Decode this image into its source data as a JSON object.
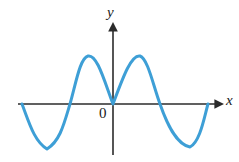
{
  "figure": {
    "title": "",
    "background_color": "#ffffff",
    "width": 239,
    "height": 162
  },
  "labels": {
    "x_axis": "x",
    "y_axis": "y",
    "origin": "0"
  },
  "colors": {
    "curve": "#3e9fd6",
    "axis": "#2b2b2b",
    "text": "#1a1a1a"
  },
  "chart_data": {
    "type": "line",
    "title": "",
    "xlabel": "x",
    "ylabel": "y",
    "grid": false,
    "legend": null,
    "annotations": [
      "0"
    ],
    "axes": {
      "x_axis_y_pixel": 104,
      "y_axis_x_pixel": 113,
      "x_axis_start_pixel": 18,
      "x_axis_arrow_tip_pixel": 222,
      "y_axis_arrow_tip_pixel": 24,
      "y_axis_bottom_pixel": 155,
      "ticks_x": [],
      "ticks_y": [],
      "xlim": [
        -3.6,
        4.1
      ],
      "ylim": [
        -1.15,
        1.6
      ]
    },
    "key_points": [
      {
        "label": "curve-start",
        "x_pixel": 22,
        "y_pixel": 104,
        "x": -3.4,
        "y": 0
      },
      {
        "label": "left-trough",
        "x_pixel": 47,
        "y_pixel": 149,
        "x": -2.5,
        "y": -1
      },
      {
        "label": "left-zero-crossing",
        "x_pixel": 70,
        "y_pixel": 104,
        "x": -1.65,
        "y": 0
      },
      {
        "label": "left-peak",
        "x_pixel": 88,
        "y_pixel": 56,
        "x": -1.0,
        "y": 1.05
      },
      {
        "label": "origin-cusp",
        "x_pixel": 113,
        "y_pixel": 104,
        "x": 0,
        "y": 0
      },
      {
        "label": "right-peak",
        "x_pixel": 140,
        "y_pixel": 56,
        "x": 1.0,
        "y": 1.05
      },
      {
        "label": "right-zero-crossing",
        "x_pixel": 160,
        "y_pixel": 104,
        "x": 1.65,
        "y": 0
      },
      {
        "label": "right-trough",
        "x_pixel": 190,
        "y_pixel": 147,
        "x": 2.5,
        "y": -0.95
      },
      {
        "label": "curve-end",
        "x_pixel": 208,
        "y_pixel": 104,
        "x": 3.2,
        "y": 0
      }
    ],
    "series": [
      {
        "name": "curve",
        "color": "#3e9fd6",
        "stroke_width": 3,
        "path": "M 22,104 C 29,122 34,141 47,149 C 60,141 64,124 70,104 C 76,83 80,58 88,56 C 97,54 104,80 113,104 C 122,80 131,54 140,56 C 148,59 153,85 160,104 C 167,124 176,144 190,147 C 200,142 204,118 208,104"
      }
    ]
  }
}
